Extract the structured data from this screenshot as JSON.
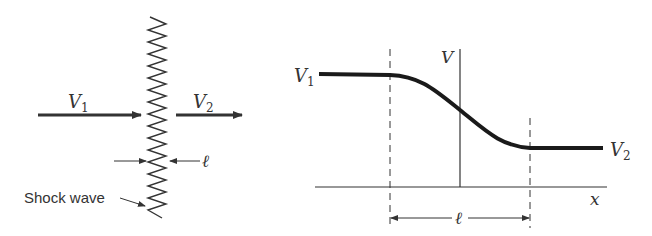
{
  "left_panel": {
    "upstream_velocity": {
      "symbol": "V",
      "subscript": "1"
    },
    "downstream_velocity": {
      "symbol": "V",
      "subscript": "2"
    },
    "thickness_label": "ℓ",
    "shock_label": "Shock wave"
  },
  "right_panel": {
    "y_axis_label": "V",
    "x_axis_label": "x",
    "upstream_level": {
      "symbol": "V",
      "subscript": "1"
    },
    "downstream_level": {
      "symbol": "V",
      "subscript": "2"
    },
    "thickness_label": "ℓ"
  },
  "colors": {
    "ink": "#333333",
    "curve": "#1a1a1a",
    "background": "#ffffff"
  }
}
